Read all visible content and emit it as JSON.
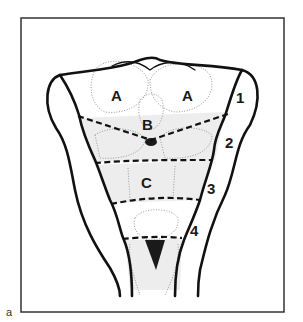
{
  "figure": {
    "panel_label": "a",
    "frame_color": "#333333",
    "line_color": "#111111",
    "regions": [
      {
        "id": "A-left",
        "text": "A"
      },
      {
        "id": "A-right",
        "text": "A"
      },
      {
        "id": "B",
        "text": "B"
      },
      {
        "id": "C",
        "text": "C"
      }
    ],
    "levels": [
      {
        "id": "level-1",
        "text": "1"
      },
      {
        "id": "level-2",
        "text": "2"
      },
      {
        "id": "level-3",
        "text": "3"
      },
      {
        "id": "level-4",
        "text": "4"
      }
    ]
  }
}
